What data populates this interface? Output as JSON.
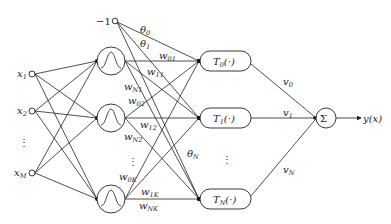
{
  "diagram": {
    "type": "neural-network",
    "input_nodes": [
      {
        "label": "x",
        "sub": "1",
        "x": 32,
        "y": 74
      },
      {
        "label": "x",
        "sub": "2",
        "x": 32,
        "y": 111
      },
      {
        "label": "x",
        "sub": "M",
        "x": 32,
        "y": 173
      }
    ],
    "input_ellipsis": "⋮",
    "bias_node": {
      "label": "−1",
      "x": 114,
      "y": 21
    },
    "hidden_nodes": [
      {
        "x": 111,
        "y": 61
      },
      {
        "x": 111,
        "y": 118
      },
      {
        "x": 111,
        "y": 199
      }
    ],
    "hidden_ellipsis": "⋮",
    "basis_nodes": [
      {
        "label": "T",
        "sub": "0",
        "arg": "(·)",
        "y": 61
      },
      {
        "label": "T",
        "sub": "1",
        "arg": "(·)",
        "y": 118
      },
      {
        "label": "T",
        "sub": "N",
        "arg": "(·)",
        "y": 199
      }
    ],
    "basis_ellipsis": "⋮",
    "bias_weights": [
      {
        "label": "θ",
        "sub": "0"
      },
      {
        "label": "θ",
        "sub": "1"
      },
      {
        "label": "θ",
        "sub": "N"
      }
    ],
    "hidden_weights": [
      {
        "label": "w",
        "sub": "01"
      },
      {
        "label": "w",
        "sub": "11"
      },
      {
        "label": "w",
        "sub": "N1"
      },
      {
        "label": "w",
        "sub": "02"
      },
      {
        "label": "w",
        "sub": "12"
      },
      {
        "label": "w",
        "sub": "N2"
      },
      {
        "label": "w",
        "sub": "0K"
      },
      {
        "label": "w",
        "sub": "1K"
      },
      {
        "label": "w",
        "sub": "NK"
      }
    ],
    "output_weights": [
      {
        "label": "v",
        "sub": "0"
      },
      {
        "label": "v",
        "sub": "1"
      },
      {
        "label": "v",
        "sub": "N"
      }
    ],
    "sum_node": {
      "label": "Σ",
      "x": 326,
      "y": 118
    },
    "output": {
      "label": "y(x)"
    }
  }
}
